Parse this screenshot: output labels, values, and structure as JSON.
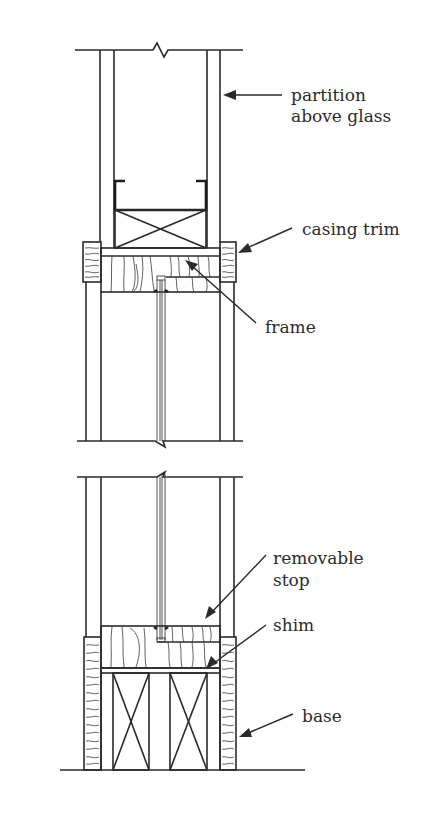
{
  "diagram": {
    "type": "architectural-section-detail",
    "labels": [
      {
        "id": "partition",
        "lines": [
          "partition",
          "above glass"
        ]
      },
      {
        "id": "casing_trim",
        "lines": [
          "casing trim"
        ]
      },
      {
        "id": "frame",
        "lines": [
          "frame"
        ]
      },
      {
        "id": "removable_stop",
        "lines": [
          "removable",
          "stop"
        ]
      },
      {
        "id": "shim",
        "lines": [
          "shim"
        ]
      },
      {
        "id": "base",
        "lines": [
          "base"
        ]
      }
    ],
    "colors": {
      "line": "#2a2a2a",
      "text": "#2b2b2b",
      "background": "#ffffff"
    }
  }
}
